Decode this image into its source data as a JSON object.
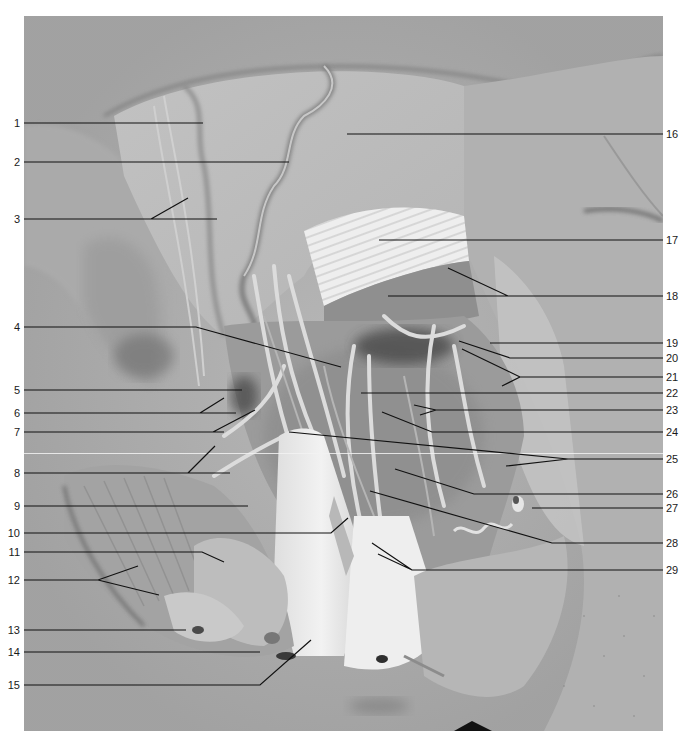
{
  "figure": {
    "type": "anatomical-dissection-photograph",
    "tone": "grayscale",
    "background_color": "#ffffff",
    "photo_base_color": "#a9a9a9"
  },
  "labels_left": [
    {
      "id": "1",
      "text": "1",
      "y": 123
    },
    {
      "id": "2",
      "text": "2",
      "y": 162
    },
    {
      "id": "3",
      "text": "3",
      "y": 219
    },
    {
      "id": "4",
      "text": "4",
      "y": 327
    },
    {
      "id": "5",
      "text": "5",
      "y": 390
    },
    {
      "id": "6",
      "text": "6",
      "y": 413
    },
    {
      "id": "7",
      "text": "7",
      "y": 432
    },
    {
      "id": "8",
      "text": "8",
      "y": 473
    },
    {
      "id": "9",
      "text": "9",
      "y": 506
    },
    {
      "id": "10",
      "text": "10",
      "y": 533
    },
    {
      "id": "11",
      "text": "11",
      "y": 552
    },
    {
      "id": "12",
      "text": "12",
      "y": 580
    },
    {
      "id": "13",
      "text": "13",
      "y": 630
    },
    {
      "id": "14",
      "text": "14",
      "y": 652
    },
    {
      "id": "15",
      "text": "15",
      "y": 685
    }
  ],
  "labels_right": [
    {
      "id": "16",
      "text": "16",
      "y": 134
    },
    {
      "id": "17",
      "text": "17",
      "y": 240
    },
    {
      "id": "18",
      "text": "18",
      "y": 296
    },
    {
      "id": "19",
      "text": "19",
      "y": 343
    },
    {
      "id": "20",
      "text": "20",
      "y": 358
    },
    {
      "id": "21",
      "text": "21",
      "y": 377
    },
    {
      "id": "22",
      "text": "22",
      "y": 393
    },
    {
      "id": "23",
      "text": "23",
      "y": 410
    },
    {
      "id": "24",
      "text": "24",
      "y": 432
    },
    {
      "id": "25",
      "text": "25",
      "y": 459
    },
    {
      "id": "26",
      "text": "26",
      "y": 494
    },
    {
      "id": "27",
      "text": "27",
      "y": 508
    },
    {
      "id": "28",
      "text": "28",
      "y": 543
    },
    {
      "id": "29",
      "text": "29",
      "y": 570
    }
  ]
}
